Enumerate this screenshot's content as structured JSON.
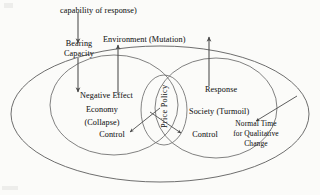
{
  "diagram": {
    "background_color": "#fbfbf9",
    "stroke_color": "#5d5d5d",
    "text_color": "#262626",
    "labels": {
      "capability_of_response": "capability of response)",
      "environment_mutation": "Environment (Mutation)",
      "bearing_capacity_line1": "Bearing",
      "bearing_capacity_line2": "Capacity",
      "negative_effect": "Negative Effect",
      "economy": "Economy",
      "collapse": "(Collapse)",
      "control_left": "Control",
      "price_policy": "Price Policy",
      "response": "Response",
      "society_turmoil": "Society (Turmoil)",
      "control_right": "Control",
      "normal_time_line1": "Normal Time",
      "normal_time_line2": "for Qualitative",
      "normal_time_line3": "Change"
    },
    "shapes": {
      "outer_ellipse": "outer-boundary-ellipse",
      "left_ellipse": "economy-domain-ellipse",
      "right_ellipse": "society-domain-ellipse",
      "center_ellipse": "price-policy-ellipse"
    },
    "arrows": {
      "capability_down": "capability-to-bearing-capacity-arrow",
      "bearing_down": "bearing-capacity-to-negative-effect-arrow",
      "negative_up": "negative-effect-to-environment-arrow",
      "response_up": "response-to-mutation-arrow",
      "policy_to_left_control": "price-policy-to-economy-control-arrow",
      "policy_to_right_control": "price-policy-to-society-control-arrow",
      "normal_time_in": "normal-time-inbound-arrow"
    }
  }
}
